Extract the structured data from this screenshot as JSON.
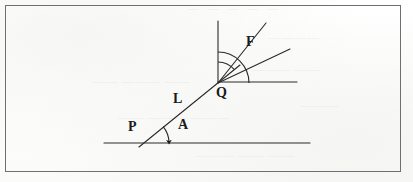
{
  "figure": {
    "kind": "geometry-diagram",
    "frame": {
      "stroke_color": "#6f6f70",
      "fill": "transparent"
    },
    "ink_color": "#1b1b1b",
    "background_color": "#fdfdfc",
    "labels": [
      {
        "id": "P",
        "text": "P",
        "x": 128,
        "y": 120
      },
      {
        "id": "L",
        "text": "L",
        "x": 173,
        "y": 92
      },
      {
        "id": "Q",
        "text": "Q",
        "x": 216,
        "y": 86
      },
      {
        "id": "A",
        "text": "A",
        "x": 178,
        "y": 118
      },
      {
        "id": "F",
        "text": "F",
        "x": 246,
        "y": 35
      }
    ],
    "points": {
      "P": {
        "x": 143,
        "y": 143
      },
      "Q": {
        "x": 218,
        "y": 83
      }
    },
    "lines": [
      {
        "id": "baseline",
        "x1": 104,
        "y1": 143,
        "x2": 310,
        "y2": 143
      },
      {
        "id": "segment-PQ",
        "x1": 139,
        "y1": 147,
        "x2": 240,
        "y2": 65
      },
      {
        "id": "vertical-at-Q",
        "x1": 218,
        "y1": 21,
        "x2": 218,
        "y2": 83
      },
      {
        "id": "horizontal-at-Q",
        "x1": 218,
        "y1": 82,
        "x2": 297,
        "y2": 82
      },
      {
        "id": "ray-steep-F",
        "x1": 218,
        "y1": 83,
        "x2": 266,
        "y2": 23
      },
      {
        "id": "ray-shallow",
        "x1": 218,
        "y1": 83,
        "x2": 290,
        "y2": 49
      }
    ],
    "arcs": [
      {
        "id": "angle-A-arc",
        "center_x": 143,
        "center_y": 143,
        "radius": 26,
        "from_deg": 39,
        "to_deg": 0,
        "arrow": true
      },
      {
        "id": "angle-F-inner-arc",
        "center_x": 218,
        "center_y": 83,
        "radius": 21,
        "from_deg": 90,
        "to_deg": 51,
        "arrow": false
      },
      {
        "id": "angle-F-outer-arc",
        "center_x": 218,
        "center_y": 83,
        "radius": 31,
        "from_deg": 90,
        "to_deg": 0,
        "arrow": false
      }
    ]
  },
  "bleed_through": {
    "note": "faint illegible text showing through from the reverse side of the page",
    "top": "— — — — —",
    "a": "—— ——— ——",
    "b": "————",
    "c": "——— ——",
    "d": "—— ——— ———",
    "e": "——— —— ——",
    "f": "———"
  }
}
